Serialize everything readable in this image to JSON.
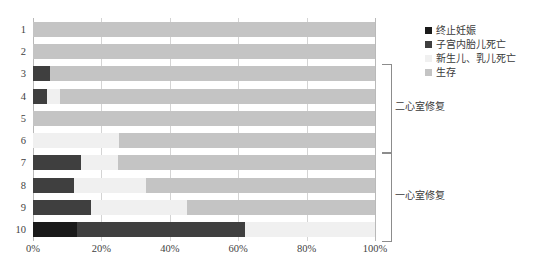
{
  "chart_data": {
    "type": "bar",
    "orientation": "horizontal",
    "stacked": true,
    "stacked_percent": true,
    "title": "",
    "xlabel": "",
    "ylabel": "",
    "xlim": [
      0,
      100
    ],
    "grid": true,
    "legend_position": "right-top",
    "categories": [
      "1",
      "2",
      "3",
      "4",
      "5",
      "6",
      "7",
      "8",
      "9",
      "10"
    ],
    "xticks": [
      0,
      20,
      40,
      60,
      80,
      100
    ],
    "xticklabels": [
      "0%",
      "20%",
      "40%",
      "60%",
      "80%",
      "100%"
    ],
    "series": [
      {
        "name": "终止妊娠",
        "color": "#1a1a1a",
        "values": [
          0,
          0,
          0,
          0,
          0,
          0,
          0,
          0,
          0,
          13
        ]
      },
      {
        "name": "子宫内胎儿死亡",
        "color": "#3f3f3f",
        "values": [
          0,
          0,
          5,
          4,
          0,
          0,
          14,
          12,
          17,
          49
        ]
      },
      {
        "name": "新生儿、乳儿死亡",
        "color": "#f0f0f0",
        "values": [
          0,
          0,
          0,
          4,
          0,
          25,
          11,
          21,
          28,
          38
        ]
      },
      {
        "name": "生存",
        "color": "#c4c4c4",
        "values": [
          100,
          100,
          95,
          92,
          100,
          75,
          75,
          67,
          55,
          0
        ]
      }
    ],
    "group_brackets": [
      {
        "label": "二心室修复",
        "rows": [
          "3",
          "4",
          "5",
          "6"
        ],
        "start_index": 2,
        "end_index": 5
      },
      {
        "label": "一心室修复",
        "rows": [
          "7",
          "8",
          "9",
          "10"
        ],
        "start_index": 6,
        "end_index": 9
      }
    ],
    "caption": ""
  },
  "legend": {
    "items": [
      {
        "label": "终止妊娠",
        "color": "#1a1a1a"
      },
      {
        "label": "子宫内胎儿死亡",
        "color": "#3f3f3f"
      },
      {
        "label": "新生儿、乳儿死亡",
        "color": "#f0f0f0"
      },
      {
        "label": "生存",
        "color": "#c4c4c4"
      }
    ]
  }
}
